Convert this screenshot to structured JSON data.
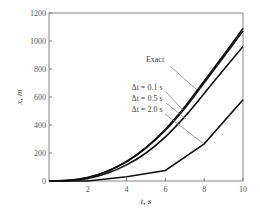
{
  "chart_data": {
    "type": "line",
    "title": "",
    "xlabel": "t, s",
    "ylabel": "x, m",
    "xlim": [
      0,
      10
    ],
    "ylim": [
      0,
      1200
    ],
    "xticks": [
      2,
      4,
      6,
      8,
      10
    ],
    "yticks": [
      0,
      200,
      400,
      600,
      800,
      1000,
      1200
    ],
    "grid": false,
    "legend": "annotations with leader lines",
    "series": [
      {
        "name": "Exact",
        "x": [
          0,
          1,
          2,
          3,
          4,
          5,
          6,
          7,
          8,
          9,
          10
        ],
        "values": [
          0,
          4,
          25,
          70,
          140,
          240,
          370,
          530,
          715,
          900,
          1090
        ]
      },
      {
        "name": "Δt = 0.1 s",
        "x": [
          0,
          1,
          2,
          3,
          4,
          5,
          6,
          7,
          8,
          9,
          10
        ],
        "values": [
          0,
          4,
          24,
          68,
          137,
          235,
          362,
          520,
          702,
          885,
          1072
        ]
      },
      {
        "name": "Δt = 0.5 s",
        "x": [
          0,
          1,
          2,
          3,
          4,
          5,
          6,
          7,
          8,
          9,
          10
        ],
        "values": [
          0,
          3,
          18,
          55,
          115,
          200,
          315,
          460,
          625,
          795,
          960
        ]
      },
      {
        "name": "Δt = 2.0 s",
        "x": [
          0,
          2,
          4,
          6,
          8,
          10
        ],
        "values": [
          0,
          0,
          30,
          75,
          265,
          580
        ]
      }
    ],
    "annotations": [
      {
        "text": "Exact",
        "label_x": 155,
        "label_y": 62
      },
      {
        "text": "Δt = 0.1 s",
        "label_x": 147,
        "label_y": 90
      },
      {
        "text": "Δt = 0.5 s",
        "label_x": 147,
        "label_y": 101
      },
      {
        "text": "Δt = 2.0 s",
        "label_x": 147,
        "label_y": 112
      }
    ]
  },
  "labels": {
    "xlabel": "t, s",
    "ylabel": "x, m",
    "exact": "Exact",
    "dt01": "Δt = 0.1 s",
    "dt05": "Δt = 0.5 s",
    "dt20": "Δt = 2.0 s"
  }
}
